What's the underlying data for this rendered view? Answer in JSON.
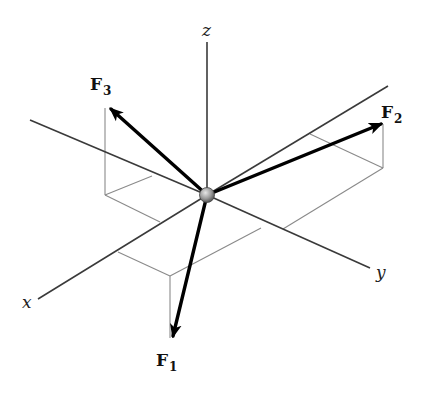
{
  "diagram": {
    "type": "3D force vector diagram",
    "origin": {
      "x": 207,
      "y": 195,
      "name": "particle"
    },
    "axes": [
      {
        "name": "z",
        "label": "z",
        "from": [
          207,
          195
        ],
        "to": [
          207,
          42
        ],
        "label_pos": [
          202,
          36
        ]
      },
      {
        "name": "y",
        "label": "y",
        "from": [
          207,
          195
        ],
        "to": [
          370,
          268
        ],
        "label_pos": [
          376,
          278
        ]
      },
      {
        "name": "x",
        "label": "x",
        "from": [
          207,
          195
        ],
        "to": [
          38,
          299
        ],
        "label_pos": [
          22,
          308
        ]
      },
      {
        "name": "neg-y",
        "label": "",
        "from": [
          207,
          195
        ],
        "to": [
          30,
          120
        ]
      },
      {
        "name": "neg-x",
        "label": "",
        "from": [
          207,
          195
        ],
        "to": [
          388,
          86
        ]
      }
    ],
    "forces": [
      {
        "name": "F1",
        "label": "F",
        "subscript": "1",
        "tip": [
          172,
          340
        ],
        "label_pos": [
          156,
          366
        ]
      },
      {
        "name": "F2",
        "label": "F",
        "subscript": "2",
        "tip": [
          385,
          122
        ],
        "label_pos": [
          381,
          118
        ]
      },
      {
        "name": "F3",
        "label": "F",
        "subscript": "3",
        "tip": [
          108,
          106
        ],
        "label_pos": [
          90,
          90
        ]
      }
    ],
    "colors": {
      "axis": "#3a3a3a",
      "guide": "#8a8a8a",
      "force": "#000000",
      "sphere_light": "#d8d8d8",
      "sphere_dark": "#6a6a6a"
    }
  }
}
